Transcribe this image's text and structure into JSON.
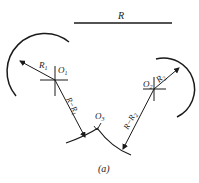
{
  "diagram": {
    "caption": "(a)",
    "reference_length_label": "R",
    "centers": {
      "o1": "O",
      "o1_sub": "1",
      "o2": "O",
      "o2_sub": "2",
      "o3": "O",
      "o3_sub": "3"
    },
    "radii": {
      "r1": "R",
      "r1_sub": "1",
      "r2": "R",
      "r2_sub": "2",
      "r_minus_r1": "R−R",
      "r_minus_r1_sub": "1",
      "r_minus_r2": "R−R",
      "r_minus_r2_sub": "2"
    },
    "colors": {
      "stroke": "#1a1a1a",
      "background": "#ffffff"
    }
  }
}
